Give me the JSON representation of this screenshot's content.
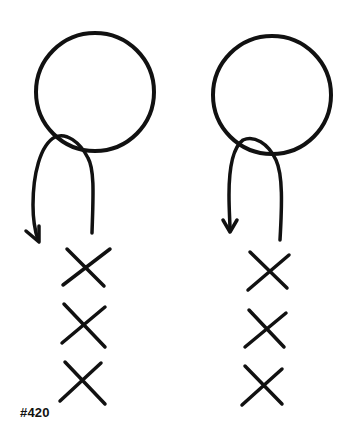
{
  "label": "#420",
  "colors": {
    "ink": "#111111",
    "background": "#ffffff"
  },
  "figures": [
    {
      "name": "left",
      "circle": {
        "cx": 95,
        "cy": 92,
        "r": 59
      },
      "loop": {
        "direction": "under-circle, arrow points down-left"
      },
      "x_marks": 3
    },
    {
      "name": "right",
      "circle": {
        "cx": 272,
        "cy": 95,
        "r": 59
      },
      "loop": {
        "direction": "under-circle, arrow points down"
      },
      "x_marks": 3
    }
  ]
}
